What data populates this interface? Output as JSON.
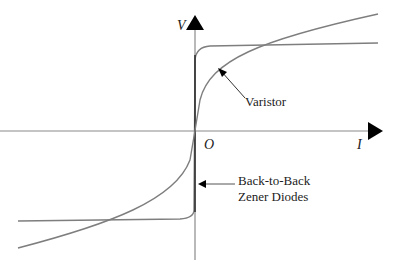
{
  "diagram": {
    "type": "I-V characteristic comparison",
    "axes": {
      "y_label": "V",
      "x_label": "I",
      "origin_label": "O"
    },
    "curves": [
      {
        "name": "Varistor",
        "label": "Varistor"
      },
      {
        "name": "Back-to-Back Zener Diodes",
        "label_line1": "Back-to-Back",
        "label_line2": "Zener Diodes"
      }
    ],
    "colors": {
      "axis": "#888888",
      "arrowhead": "#000000",
      "curve": "#808080",
      "zener_vertical": "#333333",
      "text": "#222222"
    }
  }
}
